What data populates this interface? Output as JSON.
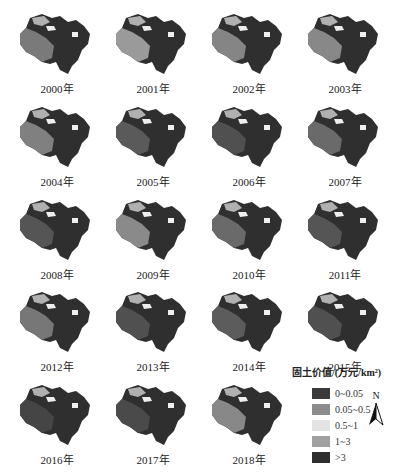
{
  "maps": [
    {
      "year": "2000年",
      "x": 12,
      "y": 4,
      "west": "#7a7a7a"
    },
    {
      "year": "2001年",
      "x": 108,
      "y": 4,
      "west": "#9a9a9a"
    },
    {
      "year": "2002年",
      "x": 204,
      "y": 4,
      "west": "#858585"
    },
    {
      "year": "2003年",
      "x": 300,
      "y": 4,
      "west": "#888888"
    },
    {
      "year": "2004年",
      "x": 12,
      "y": 97,
      "west": "#808080"
    },
    {
      "year": "2005年",
      "x": 108,
      "y": 97,
      "west": "#5a5a5a"
    },
    {
      "year": "2006年",
      "x": 204,
      "y": 97,
      "west": "#505050"
    },
    {
      "year": "2007年",
      "x": 300,
      "y": 97,
      "west": "#6a6a6a"
    },
    {
      "year": "2008年",
      "x": 12,
      "y": 190,
      "west": "#555555"
    },
    {
      "year": "2009年",
      "x": 108,
      "y": 190,
      "west": "#8a8a8a"
    },
    {
      "year": "2010年",
      "x": 204,
      "y": 190,
      "west": "#6a6a6a"
    },
    {
      "year": "2011年",
      "x": 300,
      "y": 190,
      "west": "#555555"
    },
    {
      "year": "2012年",
      "x": 12,
      "y": 282,
      "west": "#777777"
    },
    {
      "year": "2013年",
      "x": 108,
      "y": 282,
      "west": "#505050"
    },
    {
      "year": "2014年",
      "x": 204,
      "y": 282,
      "west": "#5c5c5c"
    },
    {
      "year": "2015年",
      "x": 300,
      "y": 282,
      "west": "#505050"
    },
    {
      "year": "2016年",
      "x": 12,
      "y": 375,
      "west": "#454545"
    },
    {
      "year": "2017年",
      "x": 108,
      "y": 375,
      "west": "#4a4a4a"
    },
    {
      "year": "2018年",
      "x": 204,
      "y": 375,
      "west": "#888888"
    }
  ],
  "legend": {
    "title": "固土价值/(万元/km²)",
    "items": [
      {
        "label": "0~0.05",
        "color": "#3a3a3a"
      },
      {
        "label": "0.05~0.5",
        "color": "#8c8c8c"
      },
      {
        "label": "0.5~1",
        "color": "#e4e4e4"
      },
      {
        "label": "1~3",
        "color": "#a0a0a0"
      },
      {
        "label": ">3",
        "color": "#2e2e2e"
      }
    ]
  },
  "north": {
    "label": "N"
  }
}
